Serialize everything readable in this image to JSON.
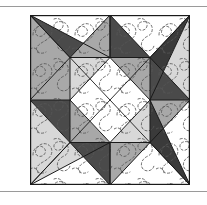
{
  "document": {
    "title": "Quilt Block Pattern Diagram",
    "has_top_rule": true,
    "has_bottom_rule": true,
    "caption": ""
  },
  "figure": {
    "name": "pieced-star-quilt-block",
    "frame": {
      "x": 30,
      "y": 8,
      "width": 160,
      "height": 170,
      "border_color": "#1a1a1a",
      "border_width": 1.2,
      "background": "#ffffff"
    },
    "palette": {
      "white": "#ffffff",
      "light_gray": "#d8d8d8",
      "medium_gray": "#a8a8a8",
      "dark_gray": "#6e6e6e",
      "charcoal": "#4a4a4a",
      "near_black": "#3a3a3a",
      "seam_line": "#1a1a1a",
      "quilting_stitch": "#555555",
      "page_rule": "#9a9a9a"
    },
    "grid": {
      "columns": 4,
      "rows": 4,
      "cell_width": 40,
      "cell_height": 42.5
    },
    "patches": [
      {
        "id": "bg-field",
        "shade": "white",
        "note": "background field with stipple quilting"
      },
      {
        "id": "star-point-top-left-dark",
        "shade": "charcoal"
      },
      {
        "id": "star-point-top-left-medium",
        "shade": "medium_gray"
      },
      {
        "id": "star-point-top-center-medium",
        "shade": "medium_gray"
      },
      {
        "id": "star-point-top-center-dark",
        "shade": "charcoal"
      },
      {
        "id": "star-point-top-right-dark",
        "shade": "near_black"
      },
      {
        "id": "star-point-left-dark",
        "shade": "charcoal"
      },
      {
        "id": "star-point-left-medium",
        "shade": "medium_gray"
      },
      {
        "id": "star-point-right-dark",
        "shade": "charcoal"
      },
      {
        "id": "star-point-right-medium",
        "shade": "medium_gray"
      },
      {
        "id": "star-point-bottom-left-light",
        "shade": "light_gray"
      },
      {
        "id": "star-point-bottom-center-dark",
        "shade": "charcoal"
      },
      {
        "id": "star-point-bottom-center-medium",
        "shade": "medium_gray"
      },
      {
        "id": "star-point-bottom-right-dark",
        "shade": "near_black"
      },
      {
        "id": "center-square-on-point",
        "shade": "white"
      },
      {
        "id": "center-corner-tl",
        "shade": "light_gray"
      },
      {
        "id": "center-corner-tr",
        "shade": "medium_gray"
      },
      {
        "id": "center-corner-bl",
        "shade": "medium_gray"
      },
      {
        "id": "center-corner-br",
        "shade": "light_gray"
      }
    ],
    "long_diagonals": [
      {
        "id": "diagonal-nw-se",
        "from": "top-left-corner",
        "to": "bottom-right-corner"
      },
      {
        "id": "diagonal-sw-ne",
        "from": "bottom-left-corner",
        "to": "top-right-corner"
      }
    ]
  }
}
